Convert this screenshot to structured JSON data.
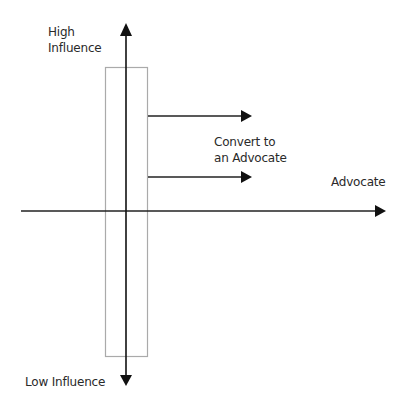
{
  "diagram": {
    "labels": {
      "high_line1": "High",
      "high_line2": "Influence",
      "low": "Low Influence",
      "convert_line1": "Convert to",
      "convert_line2": "an Advocate",
      "advocate": "Advocate"
    },
    "colors": {
      "axis": "#111111",
      "box": "#aaaaaa",
      "text": "#2a2a2a",
      "background": "#ffffff"
    }
  }
}
